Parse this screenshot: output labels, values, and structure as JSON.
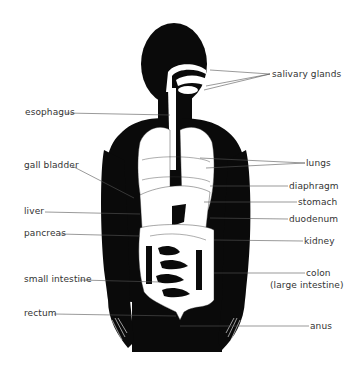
{
  "diagram": {
    "colors": {
      "silhouette": "#0a0a0a",
      "organs": "#ffffff",
      "leader": "#555555",
      "text": "#333333"
    },
    "labels_left": [
      {
        "id": "esophagus",
        "text": "esophagus",
        "x": 25,
        "y": 110
      },
      {
        "id": "gall-bladder",
        "text": "gall bladder",
        "x": 24,
        "y": 163
      },
      {
        "id": "liver",
        "text": "liver",
        "x": 24,
        "y": 209
      },
      {
        "id": "pancreas",
        "text": "pancreas",
        "x": 24,
        "y": 231
      },
      {
        "id": "small-intestine",
        "text": "small intestine",
        "x": 24,
        "y": 276
      },
      {
        "id": "rectum",
        "text": "rectum",
        "x": 24,
        "y": 310
      }
    ],
    "labels_right": [
      {
        "id": "salivary-glands",
        "text": "salivary glands",
        "x": 272,
        "y": 71
      },
      {
        "id": "lungs",
        "text": "lungs",
        "x": 306,
        "y": 160
      },
      {
        "id": "diaphragm",
        "text": "diaphragm",
        "x": 289,
        "y": 183
      },
      {
        "id": "stomach",
        "text": "stomach",
        "x": 298,
        "y": 199
      },
      {
        "id": "duodenum",
        "text": "duodenum",
        "x": 289,
        "y": 216
      },
      {
        "id": "kidney",
        "text": "kidney",
        "x": 304,
        "y": 238
      },
      {
        "id": "colon",
        "text": "colon",
        "x": 306,
        "y": 270
      },
      {
        "id": "colon-sub",
        "text": "(large intestine)",
        "x": 270,
        "y": 282
      },
      {
        "id": "anus",
        "text": "anus",
        "x": 310,
        "y": 323
      }
    ]
  }
}
